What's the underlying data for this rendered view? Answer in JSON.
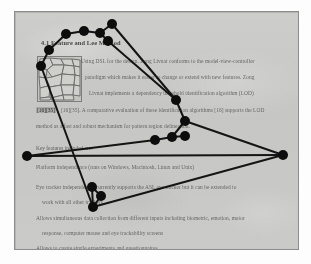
{
  "document": {
    "heading": "4.1  Feature and Lee  Method",
    "body_lines": [
      "Using DSL for the design. Zong Livnat conforms to the model-view-controller",
      "paradigm which makes it easier to change or extend with new features. Zong",
      "Livnat implements a dependency threshold identification algorithm (LOD)",
      "[16][35]. A comparative evaluation of these identification algorithms [16] supports the LOD",
      "method as a fast and robust mechanism for pattern region delineation."
    ],
    "citation_inline": "[16][35]",
    "section_label": "Key features included are:",
    "bullets": [
      "Platform independence (runs on Windows, Macintosh, Linux and Unix)",
      "Eye tracker independence: currently supports the ASL eye tracker but it can be extended to",
      "work with all other trackers",
      "Allows simultaneous data collection from different inputs including biometric, emotion, motor",
      "response, computer mouse and eye trackability screens",
      "Allows to create single experiments and questionnaires"
    ],
    "figure": {
      "caption": "",
      "alt_name": "voronoi-cell-thumbnail"
    }
  },
  "overlay_graph": {
    "node_color": "#0d0d0d",
    "edge_color": "#141414",
    "node_radius": 5.0,
    "edge_width": 2.0,
    "nodes": [
      {
        "id": 0,
        "x": 66,
        "y": 34
      },
      {
        "id": 1,
        "x": 84,
        "y": 31
      },
      {
        "id": 2,
        "x": 100,
        "y": 33
      },
      {
        "id": 3,
        "x": 112,
        "y": 24
      },
      {
        "id": 4,
        "x": 108,
        "y": 41
      },
      {
        "id": 5,
        "x": 49,
        "y": 50
      },
      {
        "id": 6,
        "x": 41,
        "y": 66
      },
      {
        "id": 7,
        "x": 176,
        "y": 100
      },
      {
        "id": 8,
        "x": 185,
        "y": 121
      },
      {
        "id": 9,
        "x": 172,
        "y": 137
      },
      {
        "id": 10,
        "x": 185,
        "y": 136
      },
      {
        "id": 11,
        "x": 155,
        "y": 140
      },
      {
        "id": 12,
        "x": 283,
        "y": 155
      },
      {
        "id": 13,
        "x": 27,
        "y": 156
      },
      {
        "id": 14,
        "x": 92,
        "y": 187
      },
      {
        "id": 15,
        "x": 101,
        "y": 196
      },
      {
        "id": 16,
        "x": 93,
        "y": 207
      }
    ],
    "edges": [
      [
        0,
        1
      ],
      [
        1,
        2
      ],
      [
        2,
        3
      ],
      [
        2,
        4
      ],
      [
        0,
        5
      ],
      [
        5,
        6
      ],
      [
        3,
        7
      ],
      [
        4,
        7
      ],
      [
        7,
        8
      ],
      [
        8,
        9
      ],
      [
        9,
        10
      ],
      [
        9,
        11
      ],
      [
        8,
        12
      ],
      [
        12,
        13
      ],
      [
        11,
        13
      ],
      [
        6,
        16
      ],
      [
        14,
        15
      ],
      [
        15,
        16
      ],
      [
        14,
        16
      ],
      [
        16,
        12
      ]
    ],
    "path_description": "closed polyline loop with node clusters"
  }
}
